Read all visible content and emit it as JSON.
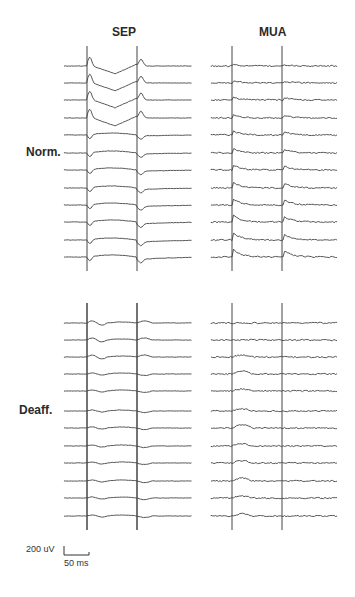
{
  "figure": {
    "column_titles": {
      "sep": "SEP",
      "mua": "MUA"
    },
    "row_labels": {
      "norm": "Norm.",
      "deaff": "Deaff."
    },
    "scale_bar": {
      "amplitude": "200 uV",
      "time": "50 ms"
    },
    "trace_color": "#444444",
    "panels": {
      "norm_sep": {
        "x0": 64,
        "x1": 192,
        "stim": [
          87,
          137
        ],
        "baselines": [
          66,
          83,
          100,
          118,
          135,
          153,
          170,
          188,
          205,
          222,
          240,
          257
        ]
      },
      "norm_mua": {
        "x0": 211,
        "x1": 337,
        "stim": [
          232,
          282
        ],
        "baselines": [
          66,
          83,
          100,
          118,
          135,
          153,
          170,
          188,
          205,
          222,
          240,
          257
        ]
      },
      "deaff_sep": {
        "x0": 64,
        "x1": 192,
        "stim": [
          87,
          137
        ],
        "baselines": [
          323,
          340,
          357,
          374,
          391,
          411,
          428,
          446,
          463,
          481,
          498,
          516
        ]
      },
      "deaff_mua": {
        "x0": 211,
        "x1": 337,
        "stim": [
          232,
          282
        ],
        "baselines": [
          323,
          340,
          357,
          374,
          391,
          411,
          428,
          446,
          463,
          481,
          498,
          516
        ]
      }
    }
  }
}
